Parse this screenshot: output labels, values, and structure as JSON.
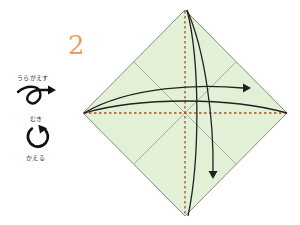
{
  "step": {
    "number": "2"
  },
  "legend": {
    "turn_over": {
      "label": "うらがえす",
      "icon": "turn-over-loop-arrow-icon"
    },
    "rotate": {
      "label_top": "むき",
      "label_bottom": "かえる",
      "icon": "rotate-circular-arrow-icon"
    }
  },
  "diagram": {
    "shape": "square paper as diamond",
    "colors": {
      "paper_fill": "#e2f0d6",
      "edge": "#8a8a8a",
      "crease": "#9aa08f",
      "valley_fold": "#a0522d",
      "arrow": "#222222",
      "step_number": "#e8a060"
    },
    "folds": [
      {
        "type": "valley",
        "direction": "vertical",
        "note": "fold top point to bottom"
      },
      {
        "type": "valley",
        "direction": "horizontal",
        "note": "fold left point to right"
      }
    ],
    "arrows": [
      {
        "from": "left corner",
        "to": "right corner",
        "orientation": "horizontal"
      },
      {
        "from": "top corner",
        "to": "bottom corner",
        "orientation": "vertical"
      }
    ]
  }
}
